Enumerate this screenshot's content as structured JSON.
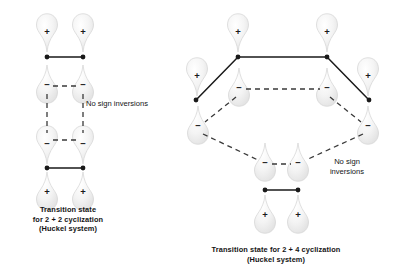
{
  "figure": {
    "type": "orbital-diagram",
    "background_color": "#ffffff",
    "line_color": "#1a1a1a",
    "lobe_fill": "#f0f0f0",
    "lobe_stroke": "#d2d2d2"
  },
  "left_structure": {
    "name": "2 + 2 cyclization transition state",
    "caption": "Transition state\nfor 2 + 2 cyclization\n(Huckel system)",
    "caption_lines": [
      "Transition state",
      "for 2 + 2 cyclization",
      "(Huckel system)"
    ],
    "note": "No sign inversions",
    "note_lines": [
      "No sign inversions"
    ],
    "orbitals": [
      {
        "id": "L-top-left",
        "sign": "+",
        "orientation": "up",
        "cx": 47,
        "cy": 32
      },
      {
        "id": "L-top-right",
        "sign": "+",
        "orientation": "up",
        "cx": 83,
        "cy": 32
      },
      {
        "id": "L-upper-mid-left",
        "sign": "−",
        "orientation": "down",
        "cx": 47,
        "cy": 85
      },
      {
        "id": "L-upper-mid-right",
        "sign": "−",
        "orientation": "down",
        "cx": 83,
        "cy": 85
      },
      {
        "id": "L-lower-mid-left",
        "sign": "−",
        "orientation": "up",
        "cx": 47,
        "cy": 144
      },
      {
        "id": "L-lower-mid-right",
        "sign": "−",
        "orientation": "up",
        "cx": 83,
        "cy": 144
      },
      {
        "id": "L-bottom-left",
        "sign": "+",
        "orientation": "down",
        "cx": 47,
        "cy": 192
      },
      {
        "id": "L-bottom-right",
        "sign": "+",
        "orientation": "down",
        "cx": 83,
        "cy": 192
      }
    ],
    "sigma_bonds": [
      {
        "x1": 47,
        "y1": 57,
        "x2": 83,
        "y2": 57
      },
      {
        "x1": 47,
        "y1": 168,
        "x2": 83,
        "y2": 168
      }
    ],
    "dashed_bonds": [
      {
        "x1": 53,
        "y1": 86,
        "x2": 77,
        "y2": 86
      },
      {
        "x1": 53,
        "y1": 140,
        "x2": 77,
        "y2": 140
      },
      {
        "x1": 47,
        "y1": 94,
        "x2": 47,
        "y2": 133
      },
      {
        "x1": 83,
        "y1": 94,
        "x2": 83,
        "y2": 133
      }
    ]
  },
  "right_structure": {
    "name": "2 + 4 cyclization transition state",
    "caption": "Transition state for 2 + 4 cyclization\n(Huckel system)",
    "caption_lines": [
      "Transition state for 2 + 4 cyclization",
      "(Huckel system)"
    ],
    "note": "No sign\ninversions",
    "note_lines": [
      "No sign",
      "inversions"
    ],
    "orbitals": [
      {
        "id": "R-top-left",
        "sign": "+",
        "orientation": "up",
        "cx": 238,
        "cy": 32
      },
      {
        "id": "R-top-right",
        "sign": "+",
        "orientation": "up",
        "cx": 327,
        "cy": 32
      },
      {
        "id": "R-mid-left-out",
        "sign": "+",
        "orientation": "up",
        "cx": 197,
        "cy": 76
      },
      {
        "id": "R-mid-right-out",
        "sign": "+",
        "orientation": "up",
        "cx": 368,
        "cy": 76
      },
      {
        "id": "R-inner-left",
        "sign": "−",
        "orientation": "down",
        "cx": 239,
        "cy": 88
      },
      {
        "id": "R-inner-right",
        "sign": "−",
        "orientation": "down",
        "cx": 327,
        "cy": 88
      },
      {
        "id": "R-low-left-out",
        "sign": "−",
        "orientation": "down",
        "cx": 198,
        "cy": 126
      },
      {
        "id": "R-low-right-out",
        "sign": "−",
        "orientation": "down",
        "cx": 368,
        "cy": 126
      },
      {
        "id": "R-bottom-left",
        "sign": "−",
        "orientation": "down",
        "cx": 265,
        "cy": 163
      },
      {
        "id": "R-bottom-right",
        "sign": "−",
        "orientation": "down",
        "cx": 298,
        "cy": 163
      },
      {
        "id": "R-base-left",
        "sign": "+",
        "orientation": "down",
        "cx": 265,
        "cy": 215
      },
      {
        "id": "R-base-right",
        "sign": "+",
        "orientation": "down",
        "cx": 298,
        "cy": 215
      }
    ],
    "sigma_bonds": [
      {
        "x1": 238,
        "y1": 57,
        "x2": 327,
        "y2": 57
      },
      {
        "x1": 265,
        "y1": 190,
        "x2": 298,
        "y2": 190
      }
    ],
    "solid_diagonals": [
      {
        "x1": 238,
        "y1": 57,
        "x2": 196,
        "y2": 100
      },
      {
        "x1": 327,
        "y1": 57,
        "x2": 369,
        "y2": 100
      }
    ],
    "dashed_bonds": [
      {
        "x1": 246,
        "y1": 89,
        "x2": 320,
        "y2": 89
      },
      {
        "x1": 236,
        "y1": 97,
        "x2": 205,
        "y2": 122
      },
      {
        "x1": 330,
        "y1": 97,
        "x2": 361,
        "y2": 122
      },
      {
        "x1": 203,
        "y1": 134,
        "x2": 258,
        "y2": 160
      },
      {
        "x1": 363,
        "y1": 134,
        "x2": 306,
        "y2": 160
      },
      {
        "x1": 272,
        "y1": 164,
        "x2": 291,
        "y2": 164
      }
    ],
    "vertex_dots": [
      {
        "cx": 238,
        "cy": 57
      },
      {
        "cx": 327,
        "cy": 57
      },
      {
        "cx": 196,
        "cy": 100
      },
      {
        "cx": 369,
        "cy": 100
      },
      {
        "cx": 265,
        "cy": 190
      },
      {
        "cx": 298,
        "cy": 190
      }
    ]
  }
}
